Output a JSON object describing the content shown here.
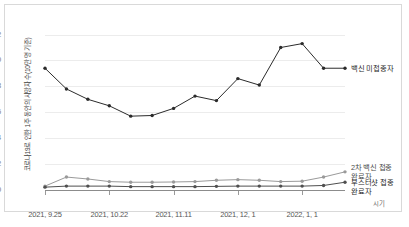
{
  "chart_data": {
    "type": "line",
    "title": "",
    "xlabel": "시기",
    "ylabel": "코로나19로 인한 1주 동안의 사망자 수(10만 명 기준)",
    "ylim": [
      0,
      13.2
    ],
    "yticks": [
      0,
      2,
      4,
      6,
      8,
      10,
      12
    ],
    "ytick_labels": [
      "0",
      "2",
      "4",
      "6",
      "8",
      "10",
      "12"
    ],
    "grid": true,
    "grid_axis": "y",
    "legend": "annotations-right",
    "x": [
      1,
      2,
      3,
      4,
      5,
      6,
      7,
      8,
      9,
      10,
      11,
      12,
      13,
      14,
      15
    ],
    "categories": [
      "2021, 9.25",
      "",
      "",
      "2021, 10.22",
      "",
      "",
      "2021, 11.11",
      "",
      "",
      "2021, 12, 1",
      "",
      "",
      "2022, 1, 1",
      "",
      ""
    ],
    "xtick_labels": [
      "2021, 9.25",
      "2021, 10.22",
      "2021, 11.11",
      "2021, 12, 1",
      "2022, 1, 1"
    ],
    "xtick_positions": [
      1,
      4,
      7,
      10,
      13
    ],
    "series": [
      {
        "name": "백신 미접종자",
        "color": "#2b2b2b",
        "values": [
          9.4,
          7.8,
          7.0,
          6.5,
          5.7,
          5.75,
          6.3,
          7.25,
          6.9,
          8.6,
          8.1,
          11.0,
          11.3,
          9.4,
          9.4
        ]
      },
      {
        "name": "2차 백신 접종 완료자",
        "color": "#9a9a9a",
        "values": [
          0.3,
          1.0,
          0.85,
          0.65,
          0.6,
          0.6,
          0.62,
          0.65,
          0.75,
          0.8,
          0.75,
          0.65,
          0.68,
          1.0,
          1.4
        ]
      },
      {
        "name": "부스터샷 접종 완료자",
        "color": "#4f4f4f",
        "values": [
          0.22,
          0.3,
          0.3,
          0.3,
          0.26,
          0.26,
          0.26,
          0.26,
          0.28,
          0.3,
          0.3,
          0.3,
          0.3,
          0.35,
          0.6
        ]
      }
    ],
    "annotations": [
      {
        "text": "백신 미접종자",
        "series": "백신 미접종자"
      },
      {
        "text": "2차 백신 접종\n완료자",
        "series": "2차 백신 접종 완료자"
      },
      {
        "text": "부스터샷 접종\n완료자",
        "series": "부스터샷 접종 완료자"
      }
    ]
  },
  "annotations": {
    "unvaccinated": "백신 미접종자",
    "second_dose_line1": "2차 백신 접종",
    "second_dose_line2": "완료자",
    "booster_line1": "부스터샷 접종",
    "booster_line2": "완료자"
  },
  "axis": {
    "y_title": "코로나19로 인한 1주 동안의 사망자 수(10만 명 기준)",
    "x_title": "시기"
  },
  "colors": {
    "unvaccinated": "#2b2b2b",
    "second_dose": "#9a9a9a",
    "booster": "#4f4f4f",
    "grid": "#ececec",
    "axis": "#8c8c8c",
    "card_border": "#d9d9d9",
    "background": "#ffffff"
  }
}
